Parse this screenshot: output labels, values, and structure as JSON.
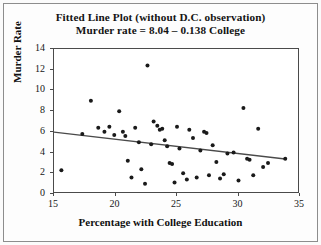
{
  "figure": {
    "title_line1": "Fitted Line Plot (without D.C. observation)",
    "title_line2": "Murder rate = 8.04 – 0.138 College"
  },
  "chart_data": {
    "type": "scatter",
    "title": "Fitted Line Plot (without D.C. observation)",
    "subtitle": "Murder rate = 8.04 – 0.138 College",
    "xlabel": "Percentage with College Education",
    "ylabel": "Murder Rate",
    "xlim": [
      15,
      35
    ],
    "ylim": [
      0,
      14
    ],
    "xticks": [
      15,
      20,
      25,
      30,
      35
    ],
    "yticks": [
      0,
      2,
      4,
      6,
      8,
      10,
      12,
      14
    ],
    "grid": false,
    "legend": false,
    "marker_color": "#1a1a1a",
    "line_color": "#4a4a4a",
    "fit_line": {
      "label": "Murder rate = 8.04 – 0.138 College",
      "intercept": 8.04,
      "slope": -0.138,
      "x_start": 15.0,
      "y_start": 5.97,
      "x_end": 33.8,
      "y_end": 3.38
    },
    "points": [
      {
        "x": 15.6,
        "y": 2.3
      },
      {
        "x": 17.3,
        "y": 5.8
      },
      {
        "x": 18.0,
        "y": 9.0
      },
      {
        "x": 18.6,
        "y": 6.4
      },
      {
        "x": 19.1,
        "y": 6.0
      },
      {
        "x": 19.5,
        "y": 6.5
      },
      {
        "x": 19.9,
        "y": 5.7
      },
      {
        "x": 20.3,
        "y": 8.0
      },
      {
        "x": 20.6,
        "y": 6.0
      },
      {
        "x": 20.8,
        "y": 5.6
      },
      {
        "x": 21.0,
        "y": 3.2
      },
      {
        "x": 21.3,
        "y": 1.6
      },
      {
        "x": 21.6,
        "y": 6.4
      },
      {
        "x": 21.9,
        "y": 5.0
      },
      {
        "x": 22.1,
        "y": 2.4
      },
      {
        "x": 22.4,
        "y": 1.0
      },
      {
        "x": 22.6,
        "y": 12.4
      },
      {
        "x": 22.9,
        "y": 4.8
      },
      {
        "x": 23.1,
        "y": 7.0
      },
      {
        "x": 23.4,
        "y": 6.6
      },
      {
        "x": 23.6,
        "y": 6.2
      },
      {
        "x": 23.8,
        "y": 6.3
      },
      {
        "x": 24.0,
        "y": 5.2
      },
      {
        "x": 24.2,
        "y": 4.6
      },
      {
        "x": 24.4,
        "y": 3.0
      },
      {
        "x": 24.6,
        "y": 2.9
      },
      {
        "x": 24.8,
        "y": 1.1
      },
      {
        "x": 25.0,
        "y": 6.5
      },
      {
        "x": 25.2,
        "y": 4.4
      },
      {
        "x": 25.5,
        "y": 2.0
      },
      {
        "x": 25.8,
        "y": 1.4
      },
      {
        "x": 26.0,
        "y": 6.2
      },
      {
        "x": 26.3,
        "y": 5.4
      },
      {
        "x": 26.6,
        "y": 1.6
      },
      {
        "x": 26.9,
        "y": 4.2
      },
      {
        "x": 27.2,
        "y": 6.0
      },
      {
        "x": 27.4,
        "y": 5.9
      },
      {
        "x": 27.6,
        "y": 1.8
      },
      {
        "x": 27.9,
        "y": 4.7
      },
      {
        "x": 28.2,
        "y": 3.1
      },
      {
        "x": 28.5,
        "y": 1.5
      },
      {
        "x": 28.8,
        "y": 1.9
      },
      {
        "x": 29.1,
        "y": 3.9
      },
      {
        "x": 29.6,
        "y": 4.0
      },
      {
        "x": 30.0,
        "y": 1.3
      },
      {
        "x": 30.4,
        "y": 8.3
      },
      {
        "x": 30.7,
        "y": 3.4
      },
      {
        "x": 30.9,
        "y": 3.3
      },
      {
        "x": 31.2,
        "y": 1.8
      },
      {
        "x": 31.6,
        "y": 6.3
      },
      {
        "x": 32.0,
        "y": 2.6
      },
      {
        "x": 32.4,
        "y": 3.0
      },
      {
        "x": 33.8,
        "y": 3.4
      }
    ]
  }
}
